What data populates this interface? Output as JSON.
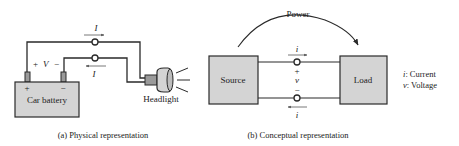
{
  "panel_a": {
    "caption": "(a) Physical representation",
    "battery_label": "Car battery",
    "battery_plus": "+",
    "battery_minus": "−",
    "voltage_plus": "+",
    "voltage_label": "V",
    "voltage_minus": "−",
    "current_top": "I",
    "current_bottom": "I",
    "headlight_label": "Headlight"
  },
  "panel_b": {
    "caption": "(b) Conceptual representation",
    "power_label": "Power",
    "source_label": "Source",
    "load_label": "Load",
    "current_top": "i",
    "current_bottom": "i",
    "voltage_plus": "+",
    "voltage_label": "v",
    "voltage_minus": "−",
    "legend": [
      {
        "symbol": "i",
        "text": ": Current"
      },
      {
        "symbol": "v",
        "text": ": Voltage"
      }
    ]
  },
  "colors": {
    "box_fill": "#d4d4d4",
    "line": "#2a2a2a"
  }
}
